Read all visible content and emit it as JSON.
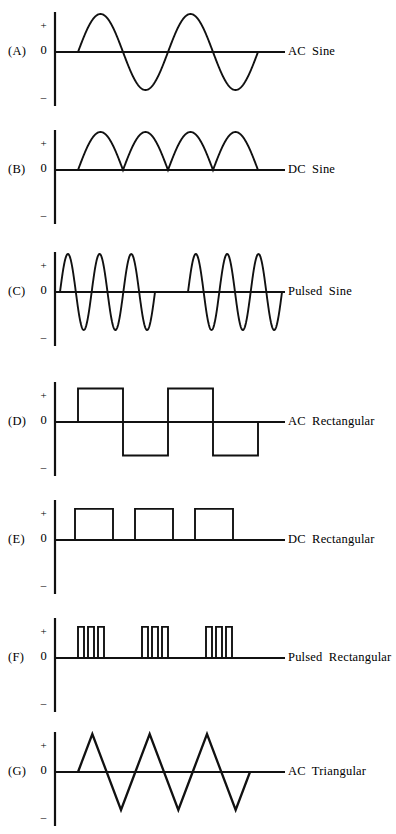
{
  "figure": {
    "axis_ticks": {
      "positive": "+",
      "zero": "0",
      "negative": "–"
    },
    "stroke_color": "#111111",
    "background_color": "#ffffff"
  },
  "chart_data": {
    "type": "line",
    "xlabel": "",
    "ylabel": "",
    "grid": false,
    "legend_position": "right",
    "ylim": [
      -1,
      1
    ],
    "axis_tick_labels": [
      "+",
      "0",
      "–"
    ],
    "panels": [
      {
        "key": "(A)",
        "label": "AC Sine",
        "waveform": "ac-sine",
        "description": "Two full alternating sine cycles, symmetric about zero",
        "cycles": 2,
        "amplitude": 1.0,
        "polarity": "bipolar",
        "start_x": 28,
        "end_x": 208,
        "axis_end_x": 235
      },
      {
        "key": "(B)",
        "label": "DC Sine",
        "waveform": "dc-sine",
        "description": "Four full-wave rectified sine humps, all positive",
        "cycles": 4,
        "amplitude": 1.0,
        "polarity": "unipolar-positive",
        "start_x": 28,
        "end_x": 208,
        "axis_end_x": 235
      },
      {
        "key": "(C)",
        "label": "Pulsed  Sine",
        "waveform": "pulsed-sine",
        "description": "Two bursts of three sine cycles separated by a quiet interval",
        "bursts": 2,
        "cycles_per_burst": 3,
        "amplitude": 1.0,
        "polarity": "bipolar",
        "burst_spans": [
          [
            10,
            105
          ],
          [
            138,
            232
          ]
        ],
        "axis_end_x": 235
      },
      {
        "key": "(D)",
        "label": "AC  Rectangular",
        "waveform": "ac-rectangular",
        "description": "Bipolar square wave, two full cycles about zero",
        "cycles": 2,
        "amplitude": 1.0,
        "polarity": "bipolar",
        "start_x": 28,
        "half_period": 45,
        "axis_end_x": 235
      },
      {
        "key": "(E)",
        "label": "DC  Rectangular",
        "waveform": "dc-rectangular",
        "description": "Three positive-only rectangular pulses",
        "pulses": 3,
        "pulse_width": 38,
        "pulse_gap": 22,
        "amplitude": 1.0,
        "polarity": "unipolar-positive",
        "start_x": 25,
        "axis_end_x": 235
      },
      {
        "key": "(F)",
        "label": "Pulsed  Rectangular",
        "waveform": "pulsed-rectangular",
        "description": "Three groups of three narrow positive pulses",
        "groups": 3,
        "pulses_per_group": 3,
        "pulse_width": 6,
        "pulse_gap": 4,
        "group_gap": 38,
        "amplitude": 1.0,
        "polarity": "unipolar-positive",
        "start_x": 28,
        "axis_end_x": 235
      },
      {
        "key": "(G)",
        "label": "AC  Triangular",
        "waveform": "ac-triangular",
        "description": "Bipolar triangular wave, three positive peaks and three negative troughs",
        "cycles": 3,
        "amplitude": 1.0,
        "polarity": "bipolar",
        "start_x": 28,
        "end_x": 200,
        "axis_end_x": 235
      }
    ]
  }
}
